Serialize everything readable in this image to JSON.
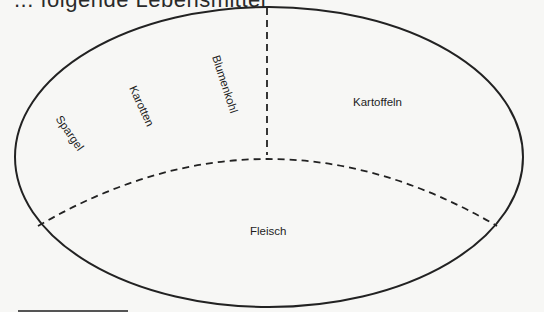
{
  "header": {
    "cut_title": "... folgende Lebensmittel"
  },
  "diagram": {
    "type": "plate-division",
    "shape": "ellipse",
    "stroke_color": "#222222",
    "regions": [
      {
        "label": "Spargel",
        "rotation_deg": 55
      },
      {
        "label": "Karotten",
        "rotation_deg": 65
      },
      {
        "label": "Blumenkohl",
        "rotation_deg": 72
      },
      {
        "label": "Kartoffeln",
        "rotation_deg": 0
      },
      {
        "label": "Fleisch",
        "rotation_deg": 0
      }
    ]
  }
}
